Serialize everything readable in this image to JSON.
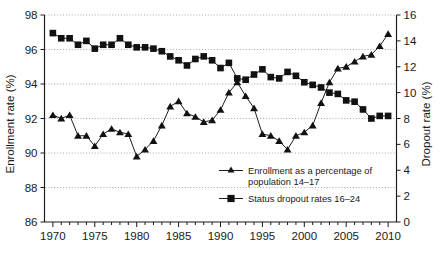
{
  "chart_data": {
    "type": "line",
    "title": "",
    "subtitle": "",
    "xlabel": "",
    "ylabel": "Enrollment rate (%)",
    "y2label": "Dropout rate (%)",
    "xlim": [
      1969,
      2011
    ],
    "ylim": [
      86,
      98
    ],
    "y2lim": [
      0,
      16
    ],
    "ytick_step": 2,
    "y2tick_step": 2,
    "xtick_step": 5,
    "xtick_minor_step": 1,
    "grid": "horizontal-dotted",
    "legend_position": "inside-lower-center",
    "x": [
      1970,
      1971,
      1972,
      1973,
      1974,
      1975,
      1976,
      1977,
      1978,
      1979,
      1980,
      1981,
      1982,
      1983,
      1984,
      1985,
      1986,
      1987,
      1988,
      1989,
      1990,
      1991,
      1992,
      1993,
      1994,
      1995,
      1996,
      1997,
      1998,
      1999,
      2000,
      2001,
      2002,
      2003,
      2004,
      2005,
      2006,
      2007,
      2008,
      2009,
      2010
    ],
    "xticklabels": [
      "1970",
      "1975",
      "1980",
      "1985",
      "1990",
      "1995",
      "2000",
      "2005",
      "2010"
    ],
    "yticklabels": [
      "86",
      "88",
      "90",
      "92",
      "94",
      "96",
      "98"
    ],
    "y2ticklabels": [
      "0",
      "2",
      "4",
      "6",
      "8",
      "10",
      "12",
      "14",
      "16"
    ],
    "series": [
      {
        "name": "Enrollment as a percentage of population 14–17",
        "axis": "left",
        "marker": "triangle",
        "color": "#111111",
        "values": [
          92.2,
          92.0,
          92.2,
          91.0,
          91.0,
          90.4,
          91.1,
          91.4,
          91.2,
          91.1,
          89.8,
          90.2,
          90.7,
          91.6,
          92.7,
          93.0,
          92.3,
          92.1,
          91.8,
          91.9,
          92.5,
          93.5,
          94.1,
          93.3,
          92.6,
          91.1,
          91.0,
          90.7,
          90.2,
          91.0,
          91.2,
          91.6,
          92.9,
          94.1,
          94.9,
          95.0,
          95.3,
          95.6,
          95.7,
          96.2,
          96.9
        ]
      },
      {
        "name": "Status dropout rates 16–24",
        "axis": "right",
        "marker": "square",
        "color": "#111111",
        "values": [
          14.6,
          14.2,
          14.2,
          13.7,
          14.0,
          13.4,
          13.7,
          13.7,
          14.2,
          13.7,
          13.5,
          13.5,
          13.4,
          13.2,
          12.8,
          12.5,
          12.1,
          12.6,
          12.8,
          12.5,
          11.9,
          12.3,
          11.1,
          11.0,
          11.4,
          11.8,
          11.2,
          11.1,
          11.6,
          11.3,
          10.8,
          10.6,
          10.4,
          10.0,
          9.9,
          9.4,
          9.3,
          8.7,
          8.0,
          8.2,
          8.2
        ]
      }
    ],
    "legend": [
      {
        "label_line1": "Enrollment as a percentage of",
        "label_line2": "population 14–17",
        "marker": "triangle"
      },
      {
        "label_line1": "Status dropout rates 16–24",
        "label_line2": "",
        "marker": "square"
      }
    ]
  }
}
